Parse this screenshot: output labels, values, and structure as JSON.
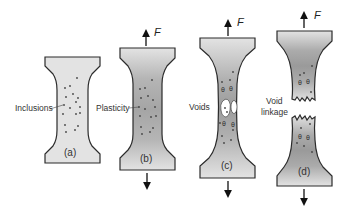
{
  "diagram": {
    "colors": {
      "specimen_fill": "#e3e3e3",
      "necked_shade": "#a8a8a8",
      "outline": "#2b2b2b",
      "inclusion": "#444444",
      "void": "#ffffff"
    },
    "force_label": "F",
    "panels": [
      {
        "id": "a",
        "label": "(a)",
        "annotation": "Inclusions",
        "has_force": false
      },
      {
        "id": "b",
        "label": "(b)",
        "annotation": "Plasticity",
        "has_force": true
      },
      {
        "id": "c",
        "label": "(c)",
        "annotation": "Voids",
        "has_force": true
      },
      {
        "id": "d",
        "label": "(d)",
        "annotation_line1": "Void",
        "annotation_line2": "linkage",
        "has_force": true
      }
    ]
  }
}
